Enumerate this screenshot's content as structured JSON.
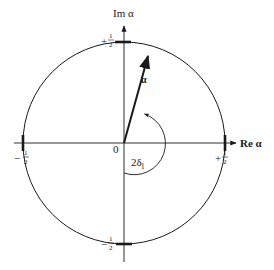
{
  "diagram": {
    "type": "argand-unit-circle",
    "axes": {
      "real_label": "Re α",
      "imag_label": "Im α"
    },
    "origin_label": "0",
    "circle_radius_label": "1/2",
    "tick_labels": {
      "right": {
        "sign": "+",
        "num": "1",
        "den": "2"
      },
      "left": {
        "sign": "−",
        "num": "1",
        "den": "2"
      },
      "top": {
        "sign": "+",
        "num": "1",
        "den": "2"
      },
      "bottom": {
        "sign": "−",
        "num": "1",
        "den": "2"
      }
    },
    "vector_label": "α",
    "angle_label": {
      "main": "2δ",
      "subscript": "l"
    },
    "colors": {
      "stroke": "#1a1a1a",
      "background": "#ffffff"
    }
  }
}
